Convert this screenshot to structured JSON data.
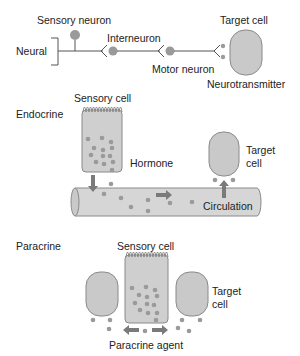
{
  "neural": {
    "section_label": "Neural",
    "sensory_neuron_label": "Sensory neuron",
    "interneuron_label": "Interneuron",
    "motor_neuron_label": "Motor neuron",
    "target_cell_label": "Target cell",
    "neurotransmitter_label": "Neurotransmitter"
  },
  "endocrine": {
    "section_label": "Endocrine",
    "sensory_cell_label": "Sensory cell",
    "hormone_label": "Hormone",
    "target_cell_label_line1": "Target",
    "target_cell_label_line2": "cell",
    "circulation_label": "Circulation"
  },
  "paracrine": {
    "section_label": "Paracrine",
    "sensory_cell_label": "Sensory cell",
    "target_cell_label_line1": "Target",
    "target_cell_label_line2": "cell",
    "agent_label": "Paracrine agent"
  },
  "colors": {
    "cell_fill": "#c9c9c9",
    "cell_stroke": "#8a8a8a",
    "dot": "#9a9a9a",
    "arrow": "#7a7a7a",
    "line": "#555555",
    "vessel_fill": "#d6d6d6"
  }
}
